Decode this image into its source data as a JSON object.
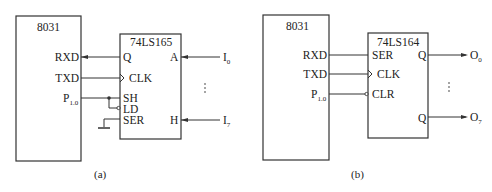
{
  "diagram_a": {
    "caption": "(a)",
    "mcu": {
      "name": "8031",
      "pins": {
        "rxd": "RXD",
        "txd": "TXD",
        "p10_main": "P",
        "p10_sub": "1.0"
      }
    },
    "chip": {
      "name": "74LS165",
      "left_pins": {
        "q": "Q",
        "clk": "CLK",
        "sh": "SH",
        "ld": "LD",
        "ser": "SER"
      },
      "right_pins": {
        "a": "A",
        "h": "H"
      }
    },
    "inputs": {
      "first_main": "I",
      "first_sub": "0",
      "last_main": "I",
      "last_sub": "7",
      "ellipsis": "⋮"
    }
  },
  "diagram_b": {
    "caption": "(b)",
    "mcu": {
      "name": "8031",
      "pins": {
        "rxd": "RXD",
        "txd": "TXD",
        "p10_main": "P",
        "p10_sub": "1.0"
      }
    },
    "chip": {
      "name": "74LS164",
      "left_pins": {
        "ser": "SER",
        "clk": "CLK",
        "clr": "CLR"
      },
      "right_pins": {
        "q_first": "Q",
        "q_last": "Q"
      }
    },
    "outputs": {
      "first_main": "O",
      "first_sub": "0",
      "last_main": "O",
      "last_sub": "7",
      "ellipsis": "⋮"
    }
  }
}
